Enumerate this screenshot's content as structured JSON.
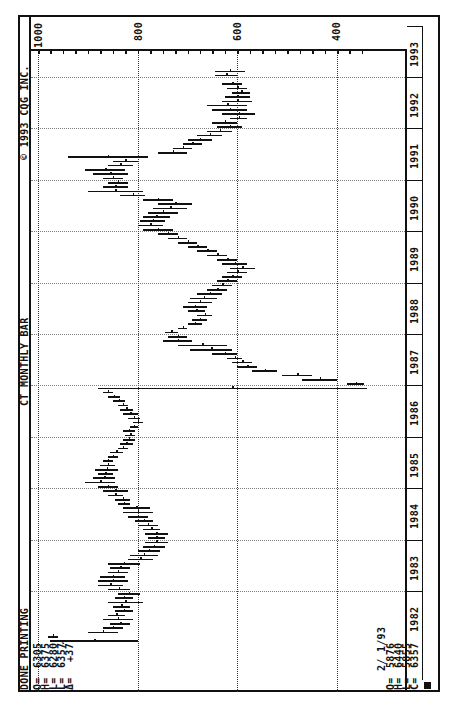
{
  "header": {
    "status": "DONE PRINTING",
    "chart_title": "CT MONTHLY BAR",
    "copyright": "© 1993 CQG INC."
  },
  "quote_box": {
    "labels": [
      "O=",
      "H=",
      "L=",
      "L=",
      "Δ="
    ],
    "values": [
      "6305",
      "6375",
      "6280",
      "6357",
      "+37"
    ],
    "tick_mark": "✓"
  },
  "cursor_box": {
    "date": "2/ 1/93",
    "labels": [
      "O=",
      "H=",
      "L=",
      "C="
    ],
    "values": [
      "5876",
      "6440",
      "5855",
      "6357"
    ]
  },
  "price_axis": {
    "labels": [
      "1000",
      "800",
      "600",
      "400"
    ]
  },
  "year_axis": {
    "labels": [
      "1982",
      "1983",
      "1984",
      "1985",
      "1986",
      "1987",
      "1988",
      "1989",
      "1990",
      "1991",
      "1992",
      "1993"
    ]
  },
  "chart_data": {
    "type": "bar",
    "subtype": "OHLC monthly bar (rotated 90°)",
    "title": "CT MONTHLY BAR",
    "xlabel": "Year",
    "ylabel": "Price",
    "ylim": [
      330,
      1000
    ],
    "y_ticks": [
      1000,
      800,
      600,
      400
    ],
    "grid": true,
    "legend": "none",
    "x_tick_labels": [
      "1982",
      "1983",
      "1984",
      "1985",
      "1986",
      "1987",
      "1988",
      "1989",
      "1990",
      "1991",
      "1992",
      "1993"
    ],
    "series": [
      {
        "name": "CT monthly high/low",
        "points": [
          {
            "t": "1982-01",
            "high": 975,
            "low": 800
          },
          {
            "t": "1982-02",
            "high": 980,
            "low": 960
          },
          {
            "t": "1982-03",
            "high": 900,
            "low": 840
          },
          {
            "t": "1982-04",
            "high": 870,
            "low": 830
          },
          {
            "t": "1982-05",
            "high": 855,
            "low": 815
          },
          {
            "t": "1982-06",
            "high": 870,
            "low": 810
          },
          {
            "t": "1982-07",
            "high": 860,
            "low": 825
          },
          {
            "t": "1982-08",
            "high": 845,
            "low": 810
          },
          {
            "t": "1982-09",
            "high": 850,
            "low": 815
          },
          {
            "t": "1982-10",
            "high": 860,
            "low": 790
          },
          {
            "t": "1982-11",
            "high": 845,
            "low": 810
          },
          {
            "t": "1982-12",
            "high": 840,
            "low": 795
          },
          {
            "t": "1983-01",
            "high": 860,
            "low": 815
          },
          {
            "t": "1983-02",
            "high": 880,
            "low": 830
          },
          {
            "t": "1983-03",
            "high": 880,
            "low": 820
          },
          {
            "t": "1983-04",
            "high": 875,
            "low": 825
          },
          {
            "t": "1983-05",
            "high": 860,
            "low": 820
          },
          {
            "t": "1983-06",
            "high": 855,
            "low": 815
          },
          {
            "t": "1983-07",
            "high": 860,
            "low": 795
          },
          {
            "t": "1983-08",
            "high": 820,
            "low": 770
          },
          {
            "t": "1983-09",
            "high": 815,
            "low": 760
          },
          {
            "t": "1983-10",
            "high": 800,
            "low": 755
          },
          {
            "t": "1983-11",
            "high": 790,
            "low": 745
          },
          {
            "t": "1983-12",
            "high": 785,
            "low": 740
          },
          {
            "t": "1984-01",
            "high": 780,
            "low": 745
          },
          {
            "t": "1984-02",
            "high": 785,
            "low": 740
          },
          {
            "t": "1984-03",
            "high": 790,
            "low": 755
          },
          {
            "t": "1984-04",
            "high": 800,
            "low": 760
          },
          {
            "t": "1984-05",
            "high": 805,
            "low": 770
          },
          {
            "t": "1984-06",
            "high": 820,
            "low": 780
          },
          {
            "t": "1984-07",
            "high": 830,
            "low": 770
          },
          {
            "t": "1984-08",
            "high": 830,
            "low": 775
          },
          {
            "t": "1984-09",
            "high": 840,
            "low": 815
          },
          {
            "t": "1984-10",
            "high": 845,
            "low": 815
          },
          {
            "t": "1984-11",
            "high": 860,
            "low": 830
          },
          {
            "t": "1984-12",
            "high": 870,
            "low": 820
          },
          {
            "t": "1985-01",
            "high": 880,
            "low": 840
          },
          {
            "t": "1985-02",
            "high": 905,
            "low": 845
          },
          {
            "t": "1985-03",
            "high": 890,
            "low": 845
          },
          {
            "t": "1985-04",
            "high": 880,
            "low": 850
          },
          {
            "t": "1985-05",
            "high": 885,
            "low": 840
          },
          {
            "t": "1985-06",
            "high": 875,
            "low": 845
          },
          {
            "t": "1985-07",
            "high": 870,
            "low": 850
          },
          {
            "t": "1985-08",
            "high": 860,
            "low": 840
          },
          {
            "t": "1985-09",
            "high": 855,
            "low": 830
          },
          {
            "t": "1985-10",
            "high": 840,
            "low": 820
          },
          {
            "t": "1985-11",
            "high": 835,
            "low": 810
          },
          {
            "t": "1985-12",
            "high": 830,
            "low": 805
          },
          {
            "t": "1986-01",
            "high": 825,
            "low": 805
          },
          {
            "t": "1986-02",
            "high": 830,
            "low": 805
          },
          {
            "t": "1986-03",
            "high": 815,
            "low": 800
          },
          {
            "t": "1986-04",
            "high": 810,
            "low": 790
          },
          {
            "t": "1986-05",
            "high": 820,
            "low": 795
          },
          {
            "t": "1986-06",
            "high": 830,
            "low": 800
          },
          {
            "t": "1986-07",
            "high": 835,
            "low": 810
          },
          {
            "t": "1986-08",
            "high": 840,
            "low": 820
          },
          {
            "t": "1986-09",
            "high": 850,
            "low": 825
          },
          {
            "t": "1986-10",
            "high": 860,
            "low": 835
          },
          {
            "t": "1986-11",
            "high": 870,
            "low": 850
          },
          {
            "t": "1986-12",
            "high": 880,
            "low": 340
          },
          {
            "t": "1987-01",
            "high": 380,
            "low": 345
          },
          {
            "t": "1987-02",
            "high": 400,
            "low": 470
          },
          {
            "t": "1987-03",
            "high": 450,
            "low": 510
          },
          {
            "t": "1987-04",
            "high": 520,
            "low": 570
          },
          {
            "t": "1987-05",
            "high": 560,
            "low": 600
          },
          {
            "t": "1987-06",
            "high": 570,
            "low": 610
          },
          {
            "t": "1987-07",
            "high": 590,
            "low": 620
          },
          {
            "t": "1987-08",
            "high": 600,
            "low": 650
          },
          {
            "t": "1987-09",
            "high": 610,
            "low": 695
          },
          {
            "t": "1987-10",
            "high": 620,
            "low": 720
          },
          {
            "t": "1987-11",
            "high": 690,
            "low": 750
          },
          {
            "t": "1987-12",
            "high": 700,
            "low": 740
          },
          {
            "t": "1988-01",
            "high": 745,
            "low": 720
          },
          {
            "t": "1988-02",
            "high": 720,
            "low": 700
          },
          {
            "t": "1988-03",
            "high": 700,
            "low": 670
          },
          {
            "t": "1988-04",
            "high": 690,
            "low": 660
          },
          {
            "t": "1988-05",
            "high": 680,
            "low": 650
          },
          {
            "t": "1988-06",
            "high": 700,
            "low": 665
          },
          {
            "t": "1988-07",
            "high": 710,
            "low": 660
          },
          {
            "t": "1988-08",
            "high": 700,
            "low": 650
          },
          {
            "t": "1988-09",
            "high": 695,
            "low": 640
          },
          {
            "t": "1988-10",
            "high": 680,
            "low": 630
          },
          {
            "t": "1988-11",
            "high": 660,
            "low": 620
          },
          {
            "t": "1988-12",
            "high": 650,
            "low": 610
          },
          {
            "t": "1989-01",
            "high": 640,
            "low": 600
          },
          {
            "t": "1989-02",
            "high": 630,
            "low": 590
          },
          {
            "t": "1989-03",
            "high": 620,
            "low": 580
          },
          {
            "t": "1989-04",
            "high": 615,
            "low": 565
          },
          {
            "t": "1989-05",
            "high": 630,
            "low": 580
          },
          {
            "t": "1989-06",
            "high": 640,
            "low": 600
          },
          {
            "t": "1989-07",
            "high": 660,
            "low": 620
          },
          {
            "t": "1989-08",
            "high": 680,
            "low": 640
          },
          {
            "t": "1989-09",
            "high": 700,
            "low": 660
          },
          {
            "t": "1989-10",
            "high": 720,
            "low": 680
          },
          {
            "t": "1989-11",
            "high": 740,
            "low": 700
          },
          {
            "t": "1989-12",
            "high": 760,
            "low": 720
          },
          {
            "t": "1990-01",
            "high": 790,
            "low": 730
          },
          {
            "t": "1990-02",
            "high": 800,
            "low": 750
          },
          {
            "t": "1990-03",
            "high": 795,
            "low": 745
          },
          {
            "t": "1990-04",
            "high": 790,
            "low": 735
          },
          {
            "t": "1990-05",
            "high": 780,
            "low": 720
          },
          {
            "t": "1990-06",
            "high": 770,
            "low": 700
          },
          {
            "t": "1990-07",
            "high": 760,
            "low": 690
          },
          {
            "t": "1990-08",
            "high": 790,
            "low": 730
          },
          {
            "t": "1990-09",
            "high": 835,
            "low": 785
          },
          {
            "t": "1990-10",
            "high": 900,
            "low": 790
          },
          {
            "t": "1990-11",
            "high": 870,
            "low": 820
          },
          {
            "t": "1990-12",
            "high": 860,
            "low": 820
          },
          {
            "t": "1991-01",
            "high": 870,
            "low": 830
          },
          {
            "t": "1991-02",
            "high": 890,
            "low": 820
          },
          {
            "t": "1991-03",
            "high": 905,
            "low": 825
          },
          {
            "t": "1991-04",
            "high": 860,
            "low": 810
          },
          {
            "t": "1991-05",
            "high": 850,
            "low": 800
          },
          {
            "t": "1991-06",
            "high": 940,
            "low": 780
          },
          {
            "t": "1991-07",
            "high": 760,
            "low": 700
          },
          {
            "t": "1991-08",
            "high": 730,
            "low": 690
          },
          {
            "t": "1991-09",
            "high": 710,
            "low": 670
          },
          {
            "t": "1991-10",
            "high": 700,
            "low": 650
          },
          {
            "t": "1991-11",
            "high": 680,
            "low": 630
          },
          {
            "t": "1991-12",
            "high": 660,
            "low": 610
          },
          {
            "t": "1992-01",
            "high": 640,
            "low": 590
          },
          {
            "t": "1992-02",
            "high": 650,
            "low": 600
          },
          {
            "t": "1992-03",
            "high": 615,
            "low": 580
          },
          {
            "t": "1992-04",
            "high": 630,
            "low": 565
          },
          {
            "t": "1992-05",
            "high": 650,
            "low": 580
          },
          {
            "t": "1992-06",
            "high": 660,
            "low": 580
          },
          {
            "t": "1992-07",
            "high": 630,
            "low": 570
          },
          {
            "t": "1992-08",
            "high": 625,
            "low": 575
          },
          {
            "t": "1992-09",
            "high": 610,
            "low": 575
          },
          {
            "t": "1992-10",
            "high": 620,
            "low": 580
          },
          {
            "t": "1992-11",
            "high": 630,
            "low": 590
          },
          {
            "t": "1993-01",
            "high": 645,
            "low": 600
          },
          {
            "t": "1993-02",
            "high": 644,
            "low": 585.5
          }
        ]
      }
    ],
    "last_bar": {
      "date": "2/1/93",
      "open": 587.6,
      "high": 644.0,
      "low": 585.5,
      "close": 635.7
    }
  }
}
